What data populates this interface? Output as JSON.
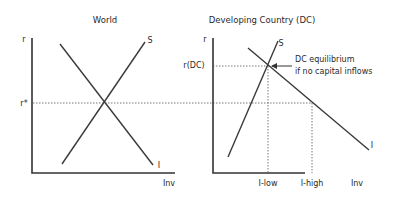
{
  "panels": {
    "world": {
      "title": "World",
      "y_axis_label": "r",
      "x_axis_label": "Inv",
      "rate_label": "r*",
      "curves": {
        "savings": "S",
        "investment": "I"
      }
    },
    "dc": {
      "title": "Developing Country (DC)",
      "y_axis_label": "r",
      "x_axis_label": "Inv",
      "rate_label": "r(DC)",
      "curves": {
        "savings": "S",
        "investment": "I"
      },
      "annotation": {
        "line1": "DC equilibrium",
        "line2": "if no capital inflows"
      },
      "x_ticks": {
        "low": "I-low",
        "high": "I-high"
      }
    }
  },
  "colors": {
    "line": "#333333",
    "background": "#ffffff"
  }
}
